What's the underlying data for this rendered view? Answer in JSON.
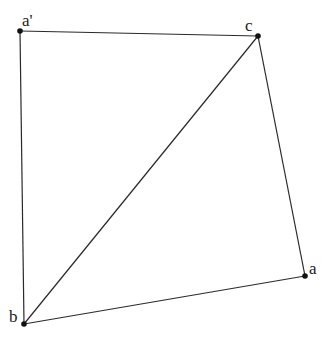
{
  "diagram": {
    "type": "geometry",
    "points": {
      "a_prime": {
        "label": "a'",
        "x": 20,
        "y": 31
      },
      "c": {
        "label": "c",
        "x": 258,
        "y": 36
      },
      "a": {
        "label": "a",
        "x": 305,
        "y": 276
      },
      "b": {
        "label": "b",
        "x": 24,
        "y": 324
      }
    },
    "edges": [
      [
        "a'",
        "c"
      ],
      [
        "a'",
        "b"
      ],
      [
        "c",
        "b"
      ],
      [
        "c",
        "a"
      ],
      [
        "b",
        "a"
      ]
    ],
    "colors": {
      "line": "#2a2a2a",
      "point": "#111111",
      "text": "#222222"
    }
  }
}
